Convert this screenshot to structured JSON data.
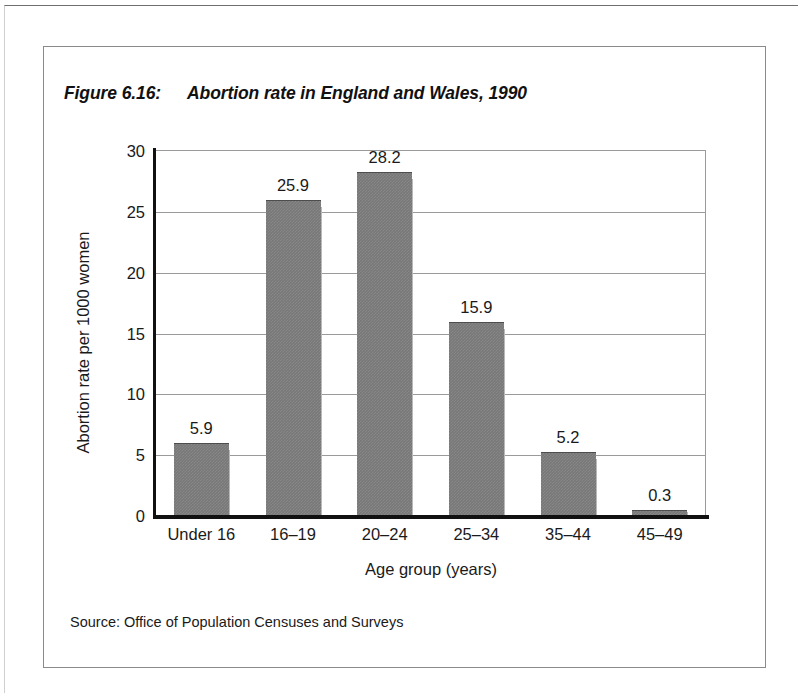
{
  "figure": {
    "number_label": "Figure 6.16:",
    "title": "Abortion rate in England and Wales, 1990",
    "source": "Source: Office of Population Censuses and Surveys"
  },
  "chart_data": {
    "type": "bar",
    "title": "Abortion rate in England and Wales, 1990",
    "categories": [
      "Under 16",
      "16–19",
      "20–24",
      "25–34",
      "35–44",
      "45–49"
    ],
    "values": [
      5.9,
      25.9,
      28.2,
      15.9,
      5.2,
      0.3
    ],
    "value_labels": [
      "5.9",
      "25.9",
      "28.2",
      "15.9",
      "5.2",
      "0.3"
    ],
    "xlabel": "Age group (years)",
    "ylabel": "Abortion rate per 1000 women",
    "ylim": [
      0,
      30
    ],
    "yticks": [
      0,
      5,
      10,
      15,
      20,
      25,
      30
    ],
    "ytick_labels": [
      "0",
      "5",
      "10",
      "15",
      "20",
      "25",
      "30"
    ],
    "grid": "horizontal",
    "legend": "none",
    "bar_color": "#787878",
    "bar_shadow_color": "#b9b9b9",
    "axis_color": "#111111",
    "gridline_color": "#9a9a9a"
  }
}
